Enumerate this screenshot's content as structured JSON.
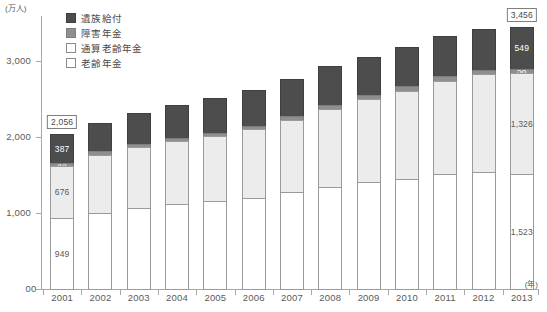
{
  "chart_data": {
    "type": "bar",
    "stacked": true,
    "title": "",
    "xlabel": "(年)",
    "ylabel": "(万人)",
    "ylim": [
      0,
      3600
    ],
    "yticks": [
      0,
      1000,
      2000,
      3000
    ],
    "ytick_labels": [
      "0",
      "1,000",
      "2,000",
      "3,000"
    ],
    "grid": false,
    "legend_position": "top-left",
    "categories": [
      "2001",
      "2002",
      "2003",
      "2004",
      "2005",
      "2006",
      "2007",
      "2008",
      "2009",
      "2010",
      "2011",
      "2012",
      "2013"
    ],
    "series": [
      {
        "name": "老齢年金",
        "key": "oldage",
        "color": "#ffffff",
        "values": [
          949,
          1010,
          1075,
          1130,
          1165,
          1210,
          1285,
          1350,
          1415,
          1465,
          1520,
          1555,
          1523
        ]
      },
      {
        "name": "通算老齢年金",
        "key": "aggregate",
        "color": "#ececec",
        "values": [
          676,
          765,
          805,
          825,
          855,
          900,
          950,
          1030,
          1090,
          1155,
          1230,
          1285,
          1326
        ]
      },
      {
        "name": "障害年金",
        "key": "disability",
        "color": "#8f8f8f",
        "values": [
          44,
          45,
          45,
          47,
          48,
          50,
          50,
          52,
          54,
          55,
          56,
          57,
          58
        ]
      },
      {
        "name": "遺族給付",
        "key": "survivor",
        "color": "#4d4d4d",
        "values": [
          387,
          375,
          400,
          435,
          450,
          470,
          490,
          505,
          505,
          520,
          525,
          535,
          549
        ]
      }
    ],
    "totals": [
      2056,
      2195,
      2325,
      2437,
      2518,
      2630,
      2775,
      2937,
      3064,
      3195,
      3331,
      3432,
      3456
    ],
    "point_labels": {
      "2001": {
        "oldage": "949",
        "aggregate": "676",
        "disability": "44",
        "survivor": "387"
      },
      "2013": {
        "oldage": "1,523",
        "aggregate": "1,326",
        "disability": "58",
        "survivor": "549"
      }
    },
    "total_callouts": {
      "2001": "2,056",
      "2013": "3,456"
    }
  },
  "legend": {
    "items": [
      {
        "label": "遺族給付",
        "swatch": "survivor"
      },
      {
        "label": "障害年金",
        "swatch": "disability"
      },
      {
        "label": "通算老齢年金",
        "swatch": "aggregate"
      },
      {
        "label": "老齢年金",
        "swatch": "oldage"
      }
    ]
  },
  "axes": {
    "y_unit": "(万人)",
    "x_unit": "(年)",
    "origin_label": "0"
  }
}
